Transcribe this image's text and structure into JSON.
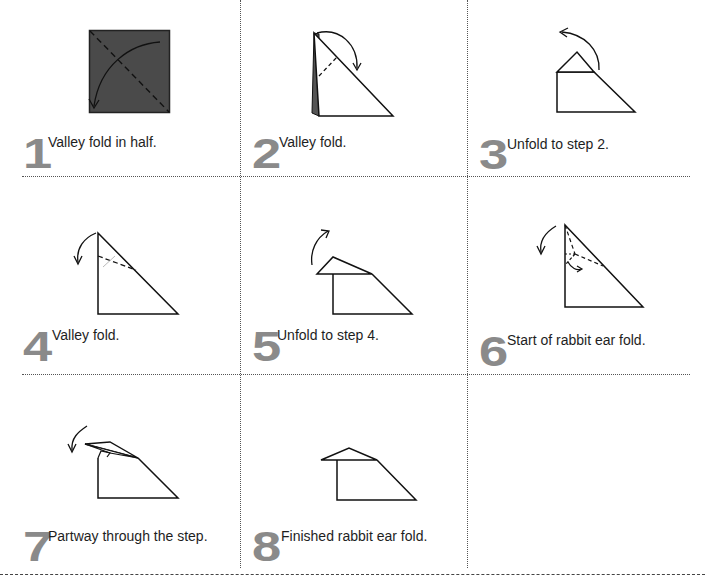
{
  "document": {
    "type": "origami instruction sheet",
    "layout": "3x3 grid, 8 steps",
    "colors": {
      "step_number": "#8a8a8a",
      "paper_colored_side": "#4a4a4a",
      "lines": "#1a1a1a",
      "dividers": "#555555"
    }
  },
  "steps": [
    {
      "number": "1",
      "caption": "Valley fold in half.",
      "icon": "square-diagonal-valley-fold-diagram"
    },
    {
      "number": "2",
      "caption": "Valley fold.",
      "icon": "triangle-valley-fold-diagram"
    },
    {
      "number": "3",
      "caption": "Unfold to step 2.",
      "icon": "triangle-folded-tip-unfold-diagram"
    },
    {
      "number": "4",
      "caption": "Valley fold.",
      "icon": "triangle-valley-fold-diagram"
    },
    {
      "number": "5",
      "caption": "Unfold to step 4.",
      "icon": "triangle-folded-tip-unfold-diagram"
    },
    {
      "number": "6",
      "caption": "Start of rabbit ear fold.",
      "icon": "rabbit-ear-crease-diagram"
    },
    {
      "number": "7",
      "caption": "Partway through the step.",
      "icon": "rabbit-ear-partway-diagram"
    },
    {
      "number": "8",
      "caption": "Finished rabbit ear fold.",
      "icon": "rabbit-ear-finished-diagram"
    }
  ]
}
